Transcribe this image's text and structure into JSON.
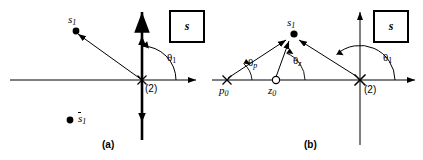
{
  "figure": {
    "stroke_color": "#000000",
    "background": "#ffffff",
    "panels": [
      {
        "id": "a",
        "caption": "(a)",
        "plane_box_label": "s",
        "origin_label": "(2)",
        "angle_labels": [
          {
            "name": "theta-1",
            "base": "θ",
            "sub": "1"
          }
        ],
        "points": [
          {
            "name": "s1",
            "base": "s",
            "sub": "1",
            "marker": "filled-dot",
            "overbar": false
          },
          {
            "name": "s1-conjugate",
            "base": "s",
            "sub": "1",
            "marker": "filled-dot",
            "overbar": true
          }
        ],
        "markers": [
          {
            "name": "double-pole-origin",
            "glyph": "x",
            "multiplicity": "(2)"
          }
        ]
      },
      {
        "id": "b",
        "caption": "(b)",
        "plane_box_label": "s",
        "origin_label": "(2)",
        "angle_labels": [
          {
            "name": "theta-p",
            "base": "θ",
            "sub": "p"
          },
          {
            "name": "theta-z",
            "base": "θ",
            "sub": "z"
          },
          {
            "name": "theta-1",
            "base": "θ",
            "sub": "1"
          }
        ],
        "points": [
          {
            "name": "s1",
            "base": "s",
            "sub": "1",
            "marker": "filled-dot",
            "overbar": false
          },
          {
            "name": "p0",
            "base": "p",
            "sub": "0",
            "marker": "cross",
            "overbar": false
          },
          {
            "name": "z0",
            "base": "z",
            "sub": "0",
            "marker": "open-circle",
            "overbar": false
          }
        ],
        "markers": [
          {
            "name": "double-pole-origin",
            "glyph": "x",
            "multiplicity": "(2)"
          }
        ]
      }
    ]
  }
}
